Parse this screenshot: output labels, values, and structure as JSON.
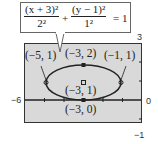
{
  "equation": {
    "term1_numerator": "(x + 3)²",
    "term1_denominator": "2²",
    "plus": "+",
    "term2_numerator": "(y − 1)²",
    "term2_denominator": "1²",
    "equals": "= 1"
  },
  "window": {
    "xmin_label": "−6",
    "xmax_label": "0",
    "ymax_label": "3",
    "ymin_label": "−1"
  },
  "points": {
    "left_vertex": "(−5, 1)",
    "top_covertex": "(−3, 2)",
    "right_vertex": "(−1, 1)",
    "center": "(−3, 1)",
    "bottom_covertex": "(−3, 0)"
  },
  "colors": {
    "screen_bg": "#d9d9d9",
    "curve": "#222222",
    "frame": "#333333"
  }
}
